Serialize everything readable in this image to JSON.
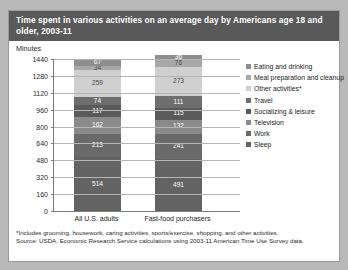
{
  "header": {
    "title": "Time spent in various activities on an average day by Americans age 18 and older, 2003-11",
    "units_label": "Minutes"
  },
  "footnote": {
    "line1": "*Includes grooming, housework, caring activities, sports/exercise, shopping, and other activities.",
    "line2": "Source: USDA, Economic Research Service calculations using 2003-11 American Time Use Survey data."
  },
  "colors": {
    "panel_bg": "#ffffff",
    "page_bg": "#b9b9b9",
    "title_bg": "#595959",
    "title_fg": "#ffffff",
    "axis": "#7c7c7c",
    "grid": "#b5b5b5",
    "series": {
      "eating_and_drinking": "#8e8e8e",
      "meal_preparation_and_cleanup": "#a8a8a8",
      "other_activities": "#cfcfcf",
      "travel": "#6e6e6e",
      "socializing_and_leisure": "#5a5a5a",
      "television": "#8a8a8a",
      "work": "#6a6a6a",
      "sleep": "#636363"
    }
  },
  "chart_data": {
    "type": "bar",
    "stacked": true,
    "title": "Time spent in various activities on an average day by Americans age 18 and older, 2003-11",
    "xlabel": "",
    "ylabel": "Minutes",
    "ylim": [
      0,
      1440
    ],
    "yticks": [
      0,
      160,
      320,
      480,
      640,
      800,
      960,
      1120,
      1280,
      1440
    ],
    "grid": true,
    "legend_position": "right",
    "categories": [
      "All U.S. adults",
      "Fast-food purchasers"
    ],
    "stack_order_bottom_to_top": [
      "Sleep",
      "Work",
      "Television",
      "Socializing & leisure",
      "Travel",
      "Other activities*",
      "Meal preparation and cleanup",
      "Eating and drinking"
    ],
    "series": [
      {
        "name": "Eating and drinking",
        "color": "#8e8e8e",
        "values": [
          67,
          36
        ]
      },
      {
        "name": "Meal preparation and cleanup",
        "color": "#a8a8a8",
        "values": [
          34,
          76
        ]
      },
      {
        "name": "Other activities*",
        "color": "#cfcfcf",
        "values": [
          259,
          273
        ]
      },
      {
        "name": "Travel",
        "color": "#6e6e6e",
        "values": [
          74,
          111
        ]
      },
      {
        "name": "Socializing & leisure",
        "color": "#5a5a5a",
        "values": [
          117,
          115
        ]
      },
      {
        "name": "Television",
        "color": "#8a8a8a",
        "values": [
          162,
          132
        ]
      },
      {
        "name": "Work",
        "color": "#6a6a6a",
        "values": [
          213,
          241
        ]
      },
      {
        "name": "Sleep",
        "color": "#636363",
        "values": [
          514,
          491
        ]
      }
    ]
  }
}
